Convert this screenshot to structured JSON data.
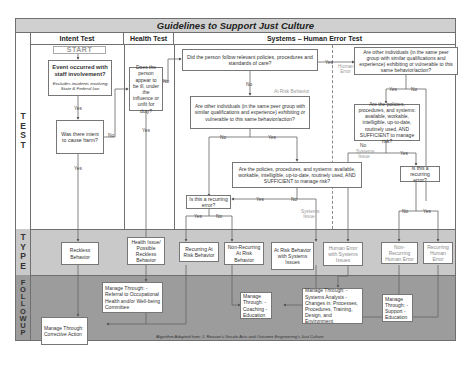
{
  "title": "Guidelines to Support Just Culture",
  "columns": {
    "intent": "Intent Test",
    "health": "Health Test",
    "systems": "Systems – Human Error Test"
  },
  "row_labels": {
    "test": "T E S T",
    "type": "T Y P E",
    "followup": "F O L L O W U P"
  },
  "test": {
    "start": "START",
    "event_box": "Event occurred with staff involvement?",
    "event_note": "Excludes incidents involving State & Federal law",
    "intent_box": "Was there intent to cause harm?",
    "health_box": "Does the person appear to be ill, under the influence or unfit for duty?",
    "policies_box": "Did the person follow relevant policies, procedures and standards of care?",
    "peer_left_box": "Are other individuals (in the same peer group with similar qualifications and experience) exhibiting or vulnerable to this same behavior/action?",
    "systems_left_box": "Are the policies, procedures, and systems: available, workable, intelligible, up-to-date, routinely used, AND SUFFICIENT to manage risk?",
    "recurring_left_box": "Is this a recurring error?",
    "peer_right_box": "Are other individuals (in the same peer group with similar qualifications and experience) exhibiting or vulnerable to this same behavior/action?",
    "systems_right_box": "Are the policies, procedures, and systems: available, workable, intelligible, up-to-date, routinely used, AND SUFFICIENT to manage risk?",
    "recurring_right_box": "Is this a recurring error?"
  },
  "edge_labels": {
    "yes": "Yes",
    "no": "No",
    "at_risk_behavior": "At Risk Behavior",
    "human_error": "Human Error",
    "systems_issue": "Systems Issue"
  },
  "types": {
    "reckless": "Reckless Behavior",
    "health_issue": "Health Issue/ Possible Reckless Behavior",
    "recurring_at_risk": "Recurring At Risk Behavior",
    "nonrecurring_at_risk": "Non-Recurring At Risk Behavior",
    "at_risk_systems": "At Risk Behavior with Systems Issues",
    "human_error_systems": "Human Error with Systems Issues",
    "nonrecurring_human": "Non-Recurring Human Error",
    "recurring_human": "Recurring Human Error"
  },
  "followup": {
    "corrective": "Manage Through: Corrective Action",
    "occupational": "Manage Through: -Referral to Occupational Health and/or Well-being Committee",
    "coaching": "Manage Through: -Coaching -Education",
    "systems_analysis": "Manage Through: -Systems Analysis -Changes in: Processes, Procedures, Training, Design, and Environment",
    "support": "Manage Through: -Support -Education"
  },
  "footer": "Algorithm Adapted from: J. Reason's Unsafe Acts and Outcome Engineering's Just Culture",
  "colors": {
    "title_bar": "#d0d0d0",
    "type_band": "#c9c9c9",
    "followup_band": "#9c9c9c",
    "line": "#6f6f6f",
    "muted_text": "#9a9a9a"
  }
}
